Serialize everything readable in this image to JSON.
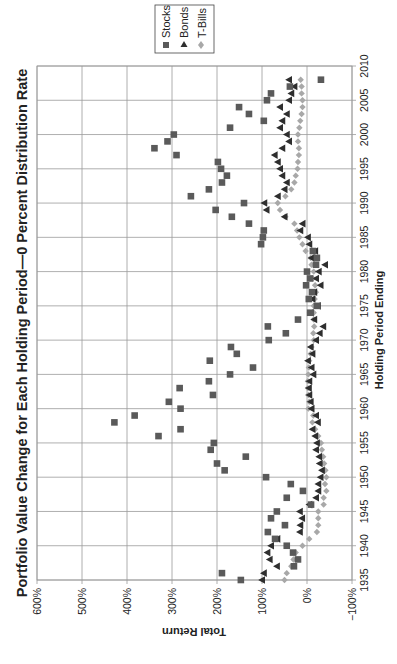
{
  "chart_data": {
    "type": "scatter",
    "title": "Portfolio Value Change for Each Holding Period—0 Percent Distribution Rate",
    "xlabel": "Holding Period Ending",
    "ylabel": "Total Return",
    "orientation": "rotated 90° counter-clockwise (page printed sideways)",
    "xlim": [
      1935,
      2010
    ],
    "ylim": [
      -100,
      600
    ],
    "x_ticks": [
      "1935",
      "1940",
      "1945",
      "1950",
      "1955",
      "1960",
      "1965",
      "1970",
      "1975",
      "1980",
      "1985",
      "1990",
      "1995",
      "2000",
      "2005",
      "2010"
    ],
    "y_ticks": [
      "−100%",
      "0%",
      "100%",
      "200%",
      "300%",
      "400%",
      "500%",
      "600%"
    ],
    "grid": true,
    "legend_position": "top-right (rotated)",
    "legend": [
      "Stocks",
      "Bonds",
      "T-Bills"
    ],
    "series": [
      {
        "name": "Stocks",
        "marker": "square",
        "color": "#5a5a5a",
        "x": [
          1935,
          1936,
          1937,
          1938,
          1939,
          1940,
          1941,
          1942,
          1943,
          1944,
          1945,
          1946,
          1947,
          1948,
          1949,
          1950,
          1951,
          1952,
          1953,
          1954,
          1955,
          1956,
          1957,
          1958,
          1959,
          1960,
          1961,
          1962,
          1963,
          1964,
          1965,
          1966,
          1967,
          1968,
          1969,
          1970,
          1971,
          1972,
          1973,
          1974,
          1975,
          1976,
          1977,
          1978,
          1979,
          1980,
          1981,
          1982,
          1983,
          1984,
          1985,
          1986,
          1987,
          1988,
          1989,
          1990,
          1991,
          1992,
          1993,
          1994,
          1995,
          1996,
          1997,
          1998,
          1999,
          2000,
          2001,
          2002,
          2003,
          2004,
          2005,
          2006,
          2007,
          2008
        ],
        "values": [
          147,
          189,
          29,
          20,
          31,
          45,
          71,
          87,
          49,
          80,
          67,
          -9,
          45,
          9,
          36,
          91,
          183,
          200,
          136,
          214,
          207,
          330,
          281,
          428,
          383,
          281,
          307,
          209,
          283,
          218,
          171,
          120,
          216,
          156,
          169,
          85,
          47,
          87,
          20,
          -7,
          -22,
          -4,
          -11,
          2,
          -7,
          0,
          -20,
          -22,
          -13,
          102,
          98,
          96,
          129,
          167,
          203,
          140,
          258,
          218,
          189,
          178,
          191,
          198,
          290,
          339,
          310,
          296,
          171,
          96,
          129,
          151,
          89,
          80,
          38,
          -31
        ]
      },
      {
        "name": "Bonds",
        "marker": "triangle",
        "color": "#2e2e2e",
        "x": [
          1935,
          1936,
          1937,
          1938,
          1939,
          1940,
          1941,
          1942,
          1943,
          1944,
          1945,
          1946,
          1947,
          1948,
          1949,
          1950,
          1951,
          1952,
          1953,
          1954,
          1955,
          1956,
          1957,
          1958,
          1959,
          1960,
          1961,
          1962,
          1963,
          1964,
          1965,
          1966,
          1967,
          1968,
          1969,
          1970,
          1971,
          1972,
          1973,
          1974,
          1975,
          1976,
          1977,
          1978,
          1979,
          1980,
          1981,
          1982,
          1983,
          1984,
          1985,
          1986,
          1987,
          1988,
          1989,
          1990,
          1991,
          1992,
          1993,
          1994,
          1995,
          1996,
          1997,
          1998,
          1999,
          2000,
          2001,
          2002,
          2003,
          2004,
          2005,
          2006,
          2007,
          2008
        ],
        "values": [
          100,
          96,
          67,
          83,
          88,
          80,
          66,
          16,
          15,
          11,
          16,
          -5,
          -20,
          -25,
          -25,
          -30,
          -33,
          -28,
          -27,
          -20,
          -22,
          -18,
          -12,
          -24,
          -20,
          -10,
          -8,
          -5,
          -4,
          -5,
          -14,
          -10,
          -2,
          -12,
          -8,
          -20,
          -28,
          -36,
          -16,
          -8,
          -24,
          -12,
          -16,
          -30,
          -20,
          -26,
          -40,
          -10,
          -18,
          -5,
          -2,
          15,
          10,
          50,
          90,
          95,
          65,
          50,
          45,
          55,
          60,
          65,
          72,
          55,
          40,
          45,
          60,
          55,
          45,
          60,
          40,
          35,
          28,
          40
        ]
      },
      {
        "name": "T-Bills",
        "marker": "diamond",
        "color": "#a8a8a8",
        "x": [
          1935,
          1936,
          1937,
          1938,
          1939,
          1940,
          1941,
          1942,
          1943,
          1944,
          1945,
          1946,
          1947,
          1948,
          1949,
          1950,
          1951,
          1952,
          1953,
          1954,
          1955,
          1956,
          1957,
          1958,
          1959,
          1960,
          1961,
          1962,
          1963,
          1964,
          1965,
          1966,
          1967,
          1968,
          1969,
          1970,
          1971,
          1972,
          1973,
          1974,
          1975,
          1976,
          1977,
          1978,
          1979,
          1980,
          1981,
          1982,
          1983,
          1984,
          1985,
          1986,
          1987,
          1988,
          1989,
          1990,
          1991,
          1992,
          1993,
          1994,
          1995,
          1996,
          1997,
          1998,
          1999,
          2000,
          2001,
          2002,
          2003,
          2004,
          2005,
          2006,
          2007,
          2008
        ],
        "values": [
          50,
          45,
          35,
          30,
          25,
          10,
          -5,
          -22,
          -25,
          -25,
          -25,
          -37,
          -37,
          -43,
          -40,
          -43,
          -41,
          -38,
          -36,
          -33,
          -31,
          -25,
          -18,
          -12,
          -14,
          -3,
          -5,
          -3,
          -2,
          -2,
          -3,
          -4,
          -5,
          -8,
          -10,
          -15,
          -14,
          -16,
          -15,
          -15,
          -15,
          -17,
          -20,
          -18,
          -13,
          -15,
          -10,
          -8,
          3,
          10,
          17,
          22,
          28,
          48,
          60,
          65,
          48,
          35,
          28,
          25,
          21,
          20,
          18,
          18,
          20,
          20,
          17,
          15,
          12,
          10,
          10,
          12,
          12,
          14
        ]
      }
    ]
  },
  "legend": {
    "items": [
      {
        "label": "Stocks",
        "icon": "square-marker-icon"
      },
      {
        "label": "Bonds",
        "icon": "triangle-marker-icon"
      },
      {
        "label": "T-Bills",
        "icon": "diamond-marker-icon"
      }
    ]
  },
  "colors": {
    "stocks": "#5a5a5a",
    "bonds": "#2e2e2e",
    "tbills": "#a8a8a8",
    "grid": "#9a9a9a"
  }
}
